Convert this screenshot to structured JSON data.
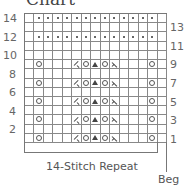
{
  "title": "Chart",
  "chart_data": {
    "type": "table",
    "title": "Chart",
    "columns": 15,
    "rows": 14,
    "legend_symbols": {
      "blank": "knit",
      "dot": "purl",
      "yo": "yarn over",
      "k2tog": "right-leaning decrease",
      "ssk": "left-leaning decrease",
      "sk2p": "centered double decrease"
    },
    "grid_rows_top_to_bottom": [
      {
        "row": 14,
        "cells": [
          "",
          "dot",
          "dot",
          "dot",
          "dot",
          "dot",
          "dot",
          "dot",
          "dot",
          "dot",
          "dot",
          "dot",
          "dot",
          "dot",
          ""
        ]
      },
      {
        "row": 13,
        "cells": [
          "",
          "",
          "",
          "",
          "",
          "",
          "",
          "",
          "",
          "",
          "",
          "",
          "",
          "",
          ""
        ]
      },
      {
        "row": 12,
        "cells": [
          "",
          "dot",
          "dot",
          "dot",
          "dot",
          "dot",
          "dot",
          "dot",
          "dot",
          "dot",
          "dot",
          "dot",
          "dot",
          "dot",
          ""
        ]
      },
      {
        "row": 11,
        "cells": [
          "",
          "",
          "",
          "",
          "",
          "",
          "",
          "",
          "",
          "",
          "",
          "",
          "",
          "",
          ""
        ]
      },
      {
        "row": 10,
        "cells": [
          "",
          "",
          "",
          "",
          "",
          "",
          "",
          "",
          "",
          "",
          "",
          "",
          "",
          "",
          ""
        ]
      },
      {
        "row": 9,
        "cells": [
          "",
          "yo",
          "",
          "",
          "",
          "k2tog",
          "yo",
          "sk2p",
          "yo",
          "ssk",
          "",
          "",
          "",
          "yo",
          ""
        ]
      },
      {
        "row": 8,
        "cells": [
          "",
          "",
          "",
          "",
          "",
          "",
          "",
          "",
          "",
          "",
          "",
          "",
          "",
          "",
          ""
        ]
      },
      {
        "row": 7,
        "cells": [
          "",
          "yo",
          "",
          "",
          "",
          "k2tog",
          "yo",
          "sk2p",
          "yo",
          "ssk",
          "",
          "",
          "",
          "yo",
          ""
        ]
      },
      {
        "row": 6,
        "cells": [
          "",
          "",
          "",
          "",
          "",
          "",
          "",
          "",
          "",
          "",
          "",
          "",
          "",
          "",
          ""
        ]
      },
      {
        "row": 5,
        "cells": [
          "",
          "yo",
          "",
          "",
          "",
          "k2tog",
          "yo",
          "sk2p",
          "yo",
          "ssk",
          "",
          "",
          "",
          "yo",
          ""
        ]
      },
      {
        "row": 4,
        "cells": [
          "",
          "",
          "",
          "",
          "",
          "",
          "",
          "",
          "",
          "",
          "",
          "",
          "",
          "",
          ""
        ]
      },
      {
        "row": 3,
        "cells": [
          "",
          "yo",
          "",
          "",
          "",
          "k2tog",
          "yo",
          "sk2p",
          "yo",
          "ssk",
          "",
          "",
          "",
          "yo",
          ""
        ]
      },
      {
        "row": 2,
        "cells": [
          "",
          "",
          "",
          "",
          "",
          "",
          "",
          "",
          "",
          "",
          "",
          "",
          "",
          "",
          ""
        ]
      },
      {
        "row": 1,
        "cells": [
          "",
          "yo",
          "",
          "",
          "",
          "k2tog",
          "yo",
          "sk2p",
          "yo",
          "ssk",
          "",
          "",
          "",
          "yo",
          ""
        ]
      }
    ],
    "left_labels": [
      "14",
      "12",
      "10",
      "8",
      "6",
      "4",
      "2"
    ],
    "right_labels": [
      "13",
      "11",
      "9",
      "7",
      "5",
      "3",
      "1"
    ],
    "repeat_label": "14-Stitch Repeat",
    "start_label": "Beg"
  }
}
